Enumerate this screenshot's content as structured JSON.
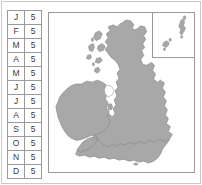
{
  "figure": {
    "type": "choropleth-map-with-month-table",
    "background_color": "#ffffff",
    "frame_color": "#c9c9c9"
  },
  "month_table": {
    "name": "month-value-table",
    "border_color": "#9a9a9a",
    "text_color": "#3a3a3a",
    "columns": [
      "month",
      "value"
    ],
    "rows": [
      {
        "month": "J",
        "value": "5"
      },
      {
        "month": "F",
        "value": "5"
      },
      {
        "month": "M",
        "value": "5"
      },
      {
        "month": "A",
        "value": "5"
      },
      {
        "month": "M",
        "value": "5"
      },
      {
        "month": "J",
        "value": "5"
      },
      {
        "month": "J",
        "value": "5"
      },
      {
        "month": "A",
        "value": "5"
      },
      {
        "month": "S",
        "value": "5"
      },
      {
        "month": "O",
        "value": "5"
      },
      {
        "month": "N",
        "value": "5"
      },
      {
        "month": "D",
        "value": "5"
      }
    ]
  },
  "map": {
    "name": "british-isles-map",
    "land_fill": "#a8a8a8",
    "land_stroke": "#8a8a8a",
    "sea_fill": "#ffffff",
    "panel_border": "#9a9a9a",
    "regions": [
      "Ireland",
      "Great Britain",
      "Scotland",
      "Wales",
      "England",
      "Hebrides",
      "Isle of Man",
      "Isle of Wight"
    ],
    "inset": {
      "name": "northern-isles-inset",
      "border_color": "#9a9a9a",
      "regions": [
        "Shetland Islands",
        "Orkney Islands"
      ]
    }
  }
}
